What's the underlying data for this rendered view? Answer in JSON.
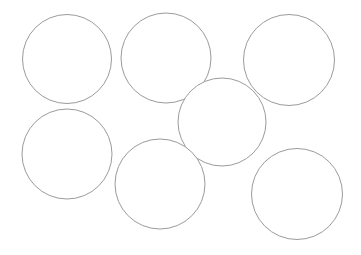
{
  "canvas": {
    "width": 361,
    "height": 255,
    "background_color": "#ffffff",
    "description": "Plain white canvas containing seven thin outlined circles"
  },
  "style": {
    "stroke_color": "#9b9b9b",
    "stroke_width": 1,
    "fill_color": "#ffffff"
  },
  "shapes": [
    {
      "name": "circle-top-left",
      "type": "circle",
      "cx": 67,
      "cy": 59,
      "r": 44.5,
      "diameter": 89,
      "stroke_color": "#9b9b9b",
      "fill_color": "#ffffff",
      "stroke_width": 1
    },
    {
      "name": "circle-top-center",
      "type": "circle",
      "cx": 166,
      "cy": 58,
      "r": 45,
      "diameter": 90,
      "stroke_color": "#9b9b9b",
      "fill_color": "#ffffff",
      "stroke_width": 1
    },
    {
      "name": "circle-top-right",
      "type": "circle",
      "cx": 289,
      "cy": 60,
      "r": 45.5,
      "diameter": 91,
      "stroke_color": "#9b9b9b",
      "fill_color": "#ffffff",
      "stroke_width": 1
    },
    {
      "name": "circle-middle-center",
      "type": "circle",
      "cx": 222,
      "cy": 122,
      "r": 44,
      "diameter": 88,
      "stroke_color": "#9b9b9b",
      "fill_color": "#ffffff",
      "stroke_width": 1
    },
    {
      "name": "circle-bottom-left",
      "type": "circle",
      "cx": 67,
      "cy": 154,
      "r": 45,
      "diameter": 90,
      "stroke_color": "#9b9b9b",
      "fill_color": "#ffffff",
      "stroke_width": 1
    },
    {
      "name": "circle-bottom-center",
      "type": "circle",
      "cx": 160,
      "cy": 184,
      "r": 45,
      "diameter": 90,
      "stroke_color": "#9b9b9b",
      "fill_color": "#ffffff",
      "stroke_width": 1
    },
    {
      "name": "circle-bottom-right",
      "type": "circle",
      "cx": 297,
      "cy": 194,
      "r": 45.5,
      "diameter": 91,
      "stroke_color": "#9b9b9b",
      "fill_color": "#ffffff",
      "stroke_width": 1
    }
  ],
  "counts": {
    "total_shapes": 7,
    "circles": 7
  }
}
